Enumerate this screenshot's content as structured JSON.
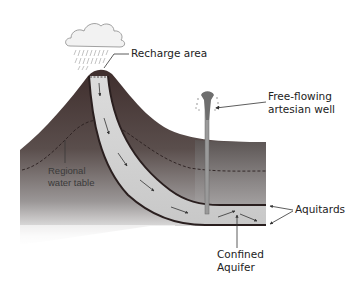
{
  "diagram": {
    "labels": {
      "recharge_area": "Recharge area",
      "artesian_well_line1": "Free-flowing",
      "artesian_well_line2": "artesian well",
      "water_table_line1": "Regional",
      "water_table_line2": "water table",
      "aquitards": "Aquitards",
      "confined_aquifer_line1": "Confined",
      "confined_aquifer_line2": "Aquifer"
    },
    "colors": {
      "ground_top": "#4a3a38",
      "ground_bottom": "#ffffff",
      "aquifer_fill": "#d4d4d4",
      "aquitard_line": "#2a1f1f",
      "cloud": "#f2f2f2",
      "rain": "#9a9a9a",
      "well": "#8a8a8a",
      "text": "#222222"
    }
  }
}
